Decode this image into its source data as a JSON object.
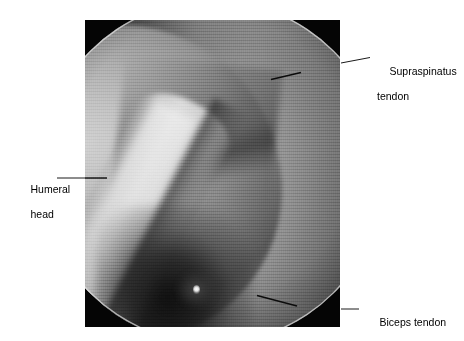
{
  "figure": {
    "type": "arthroscopic-photograph",
    "view": "shoulder joint arthroscopy, circular endoscopic field of view",
    "plate": {
      "background_color": "#050505",
      "x": 85,
      "y": 20,
      "width": 255,
      "height": 307
    },
    "scope_circle": {
      "center_x": 212,
      "center_y": 172,
      "radius": 172,
      "rim_color": "#e1e1e1"
    },
    "palette": {
      "background": "#ffffff",
      "plate": "#050505",
      "tissue_light": "#d6d6d6",
      "tissue_mid": "#8c8c8c",
      "tissue_dark": "#2a2a2a",
      "label_text": "#000000",
      "leader_line": "#000000"
    }
  },
  "labels": {
    "supraspinatus": {
      "line1": "Supraspinatus",
      "line2": "tendon",
      "leader": {
        "inside_from_x": 271,
        "inside_from_y": 79,
        "inside_to_x": 300,
        "inside_to_y": 73,
        "outside_from_x": 341,
        "outside_from_y": 63,
        "outside_to_x": 370,
        "outside_to_y": 58
      }
    },
    "humeral_head": {
      "line1": "Humeral",
      "line2": "head",
      "leader": {
        "outside_from_x": 57,
        "outside_from_y": 178,
        "outside_to_x": 85,
        "outside_to_y": 178,
        "inside_from_x": 85,
        "inside_from_y": 178,
        "inside_to_x": 106,
        "inside_to_y": 178
      }
    },
    "biceps_tendon": {
      "line1": "Biceps tendon",
      "leader": {
        "inside_from_x": 257,
        "inside_from_y": 296,
        "inside_to_x": 296,
        "inside_to_y": 306,
        "outside_from_x": 341,
        "outside_from_y": 309,
        "outside_to_x": 359,
        "outside_to_y": 309
      }
    }
  }
}
